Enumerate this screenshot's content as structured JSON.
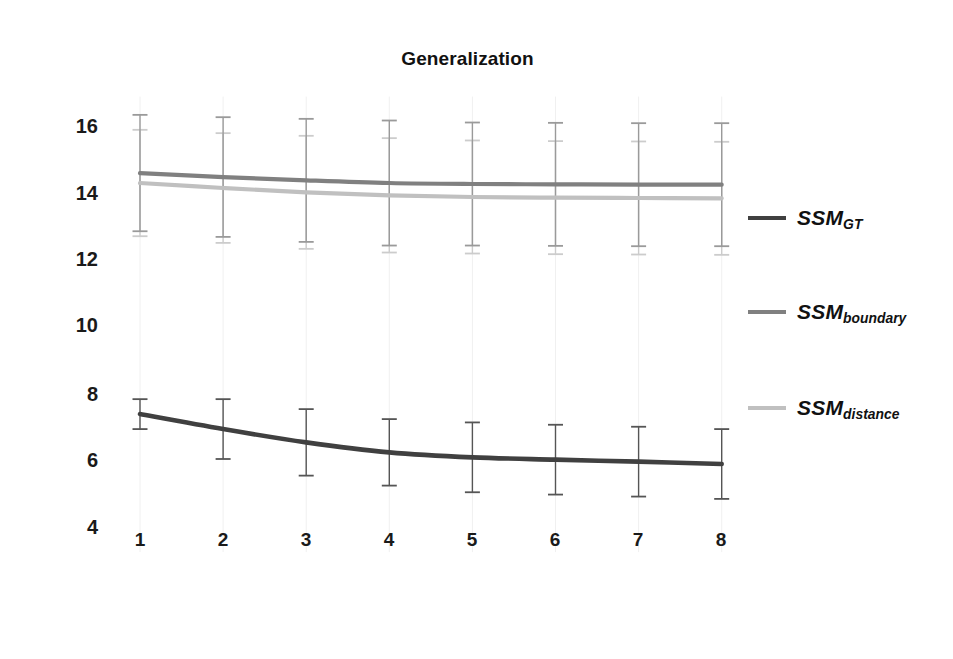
{
  "chart_data": {
    "type": "line",
    "title": "Generalization",
    "xlabel": "",
    "ylabel": "",
    "x": [
      1,
      2,
      3,
      4,
      5,
      6,
      7,
      8
    ],
    "categories": [
      "1",
      "2",
      "3",
      "4",
      "5",
      "6",
      "7",
      "8"
    ],
    "xtick_labels": [
      "1",
      "2",
      "3",
      "4",
      "5",
      "6",
      "7",
      "8"
    ],
    "ytick_labels": [
      "16",
      "14",
      "12",
      "10",
      "8",
      "6",
      "4"
    ],
    "ytick_values": [
      16,
      14,
      12,
      10,
      8,
      6,
      4
    ],
    "ylim": [
      3.2,
      16.9
    ],
    "xlim": [
      0.6,
      8.4
    ],
    "grid": false,
    "legend_position": "right",
    "error_bars": true,
    "series": [
      {
        "name": "SSM_GT",
        "label_base": "SSM",
        "label_sub": "GT",
        "color": "#404040",
        "values": [
          7.35,
          6.9,
          6.5,
          6.2,
          6.05,
          5.98,
          5.92,
          5.85
        ],
        "errors": [
          0.45,
          0.9,
          1.0,
          1.0,
          1.05,
          1.05,
          1.05,
          1.05
        ]
      },
      {
        "name": "SSM_boundary",
        "label_base": "SSM",
        "label_sub": "boundary",
        "color": "#808080",
        "values": [
          14.6,
          14.48,
          14.38,
          14.3,
          14.27,
          14.26,
          14.25,
          14.25
        ],
        "errors": [
          1.75,
          1.8,
          1.85,
          1.88,
          1.85,
          1.85,
          1.85,
          1.85
        ]
      },
      {
        "name": "SSM_distance",
        "label_base": "SSM",
        "label_sub": "distance",
        "color": "#c0c0c0",
        "values": [
          14.3,
          14.15,
          14.02,
          13.93,
          13.88,
          13.86,
          13.85,
          13.84
        ],
        "errors": [
          1.6,
          1.65,
          1.7,
          1.72,
          1.7,
          1.7,
          1.7,
          1.7
        ]
      }
    ]
  },
  "title": {
    "text": "Generalization"
  },
  "axes": {
    "y_ticks": [
      "16",
      "14",
      "12",
      "10",
      "8",
      "6",
      "4"
    ],
    "x_ticks": [
      "1",
      "2",
      "3",
      "4",
      "5",
      "6",
      "7",
      "8"
    ]
  },
  "legend": {
    "items": [
      {
        "base": "SSM",
        "sub": "GT",
        "color": "#404040"
      },
      {
        "base": "SSM",
        "sub": "boundary",
        "color": "#808080"
      },
      {
        "base": "SSM",
        "sub": "distance",
        "color": "#c0c0c0"
      }
    ]
  }
}
